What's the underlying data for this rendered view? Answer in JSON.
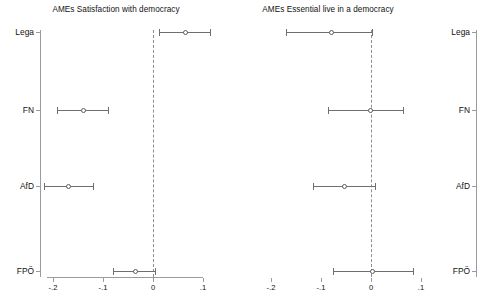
{
  "figure": {
    "width": 436,
    "height": 299,
    "background": "#ffffff",
    "line_color": "#6f6f6f",
    "axis_color": "#9b9b9b",
    "zero_line_color": "#8e8e8e"
  },
  "chart_data": [
    {
      "type": "scatter",
      "subtype": "coefficient-plot",
      "panel": "left",
      "title": "AMEs Satisfaction with democracy",
      "xlabel": "",
      "ylabel": "",
      "grid": false,
      "legend": null,
      "xlim": [
        -0.23,
        0.13
      ],
      "xticks": [
        -0.2,
        -0.1,
        0,
        0.1
      ],
      "xticklabels": [
        "-.2",
        "-.1",
        "0",
        ".1"
      ],
      "categories": [
        "Lega",
        "FN",
        "AfD",
        "FPÖ"
      ],
      "reference_line": 0,
      "points": [
        {
          "label": "Lega",
          "estimate": 0.064,
          "ci_low": 0.012,
          "ci_high": 0.114
        },
        {
          "label": "FN",
          "estimate": -0.14,
          "ci_low": -0.192,
          "ci_high": -0.09
        },
        {
          "label": "AfD",
          "estimate": -0.17,
          "ci_low": -0.218,
          "ci_high": -0.12
        },
        {
          "label": "FPÖ",
          "estimate": -0.036,
          "ci_low": -0.08,
          "ci_high": 0.004
        }
      ]
    },
    {
      "type": "scatter",
      "subtype": "coefficient-plot",
      "panel": "right",
      "title": "AMEs Essential live in a democracy",
      "xlabel": "",
      "ylabel": "",
      "grid": false,
      "legend": null,
      "xlim": [
        -0.23,
        0.13
      ],
      "xticks": [
        -0.2,
        -0.1,
        0,
        0.1
      ],
      "xticklabels": [
        "-.2",
        "-.1",
        "0",
        ".1"
      ],
      "categories": [
        "Lega",
        "FN",
        "AfD",
        "FPÖ"
      ],
      "reference_line": 0,
      "points": [
        {
          "label": "Lega",
          "estimate": -0.08,
          "ci_low": -0.17,
          "ci_high": 0.002
        },
        {
          "label": "FN",
          "estimate": -0.002,
          "ci_low": -0.086,
          "ci_high": 0.064
        },
        {
          "label": "AfD",
          "estimate": -0.054,
          "ci_low": -0.116,
          "ci_high": 0.008
        },
        {
          "label": "FPÖ",
          "estimate": 0.002,
          "ci_low": -0.076,
          "ci_high": 0.084
        }
      ]
    }
  ]
}
